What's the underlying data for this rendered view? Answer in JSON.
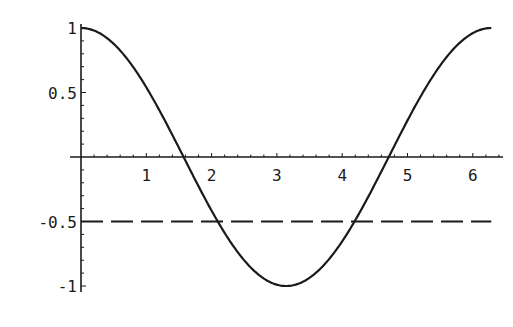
{
  "chart_data": {
    "type": "line",
    "title": "",
    "xlabel": "",
    "ylabel": "",
    "xlim": [
      0,
      6.283
    ],
    "ylim": [
      -1,
      1
    ],
    "grid": false,
    "legend": null,
    "x_ticks": [
      1,
      2,
      3,
      4,
      5,
      6
    ],
    "x_tick_labels": [
      "1",
      "2",
      "3",
      "4",
      "5",
      "6"
    ],
    "x_minor_step": 0.2,
    "y_ticks": [
      1,
      0.5,
      -0.5,
      -1
    ],
    "y_tick_labels": [
      "1",
      "0.5",
      "-0.5",
      "-1"
    ],
    "y_minor_step": 0.1,
    "series": [
      {
        "name": "cos(x)",
        "style": "solid",
        "color": "#1a1a1a",
        "function": "cos",
        "x": [
          0,
          0.5,
          1.0,
          1.5708,
          2.0,
          2.0944,
          2.5,
          3.1416,
          3.5,
          4.0,
          4.1888,
          4.7124,
          5.0,
          5.5,
          6.0,
          6.2832
        ],
        "y": [
          1,
          0.878,
          0.54,
          0,
          -0.416,
          -0.5,
          -0.801,
          -1,
          -0.936,
          -0.654,
          -0.5,
          0,
          0.284,
          0.709,
          0.96,
          1
        ]
      },
      {
        "name": "y = -0.5",
        "style": "dashed",
        "color": "#1a1a1a",
        "x": [
          0,
          6.2832
        ],
        "y": [
          -0.5,
          -0.5
        ]
      }
    ],
    "annotations": []
  },
  "layout": {
    "x_origin_px": 81,
    "y_origin_px": 157,
    "x_scale_px": 65.3,
    "y_scale_px": 129,
    "axis_color": "#1a1a1a"
  }
}
